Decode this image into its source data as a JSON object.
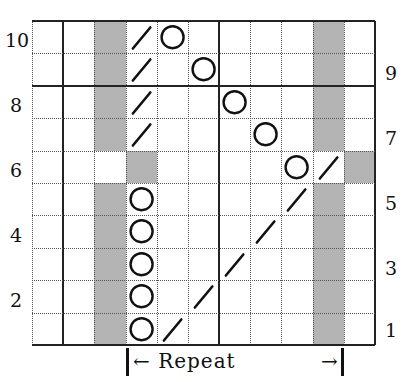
{
  "chart": {
    "columns": 11,
    "rows": 10,
    "shading_color": "#c9c9c9",
    "line_color": "#222222",
    "shaded_cells": [
      {
        "row": 10,
        "cols": [
          2,
          9
        ]
      },
      {
        "row": 9,
        "cols": [
          2,
          9
        ]
      },
      {
        "row": 8,
        "cols": [
          2,
          9
        ]
      },
      {
        "row": 7,
        "cols": [
          2,
          9
        ]
      },
      {
        "row": 6,
        "cols": [
          3,
          10
        ]
      },
      {
        "row": 5,
        "cols": [
          2,
          9
        ]
      },
      {
        "row": 4,
        "cols": [
          2,
          9
        ]
      },
      {
        "row": 3,
        "cols": [
          2,
          9
        ]
      },
      {
        "row": 2,
        "cols": [
          2,
          9
        ]
      },
      {
        "row": 1,
        "cols": [
          2,
          9
        ]
      }
    ],
    "symbols": [
      {
        "row": 10,
        "col": 3,
        "type": "slash"
      },
      {
        "row": 10,
        "col": 4,
        "type": "circle"
      },
      {
        "row": 9,
        "col": 3,
        "type": "slash"
      },
      {
        "row": 9,
        "col": 5,
        "type": "circle"
      },
      {
        "row": 8,
        "col": 3,
        "type": "slash"
      },
      {
        "row": 8,
        "col": 6,
        "type": "circle"
      },
      {
        "row": 7,
        "col": 3,
        "type": "slash"
      },
      {
        "row": 7,
        "col": 7,
        "type": "circle"
      },
      {
        "row": 6,
        "col": 8,
        "type": "circle"
      },
      {
        "row": 6,
        "col": 9,
        "type": "slash"
      },
      {
        "row": 5,
        "col": 3,
        "type": "circle"
      },
      {
        "row": 5,
        "col": 8,
        "type": "slash"
      },
      {
        "row": 4,
        "col": 3,
        "type": "circle"
      },
      {
        "row": 4,
        "col": 7,
        "type": "slash"
      },
      {
        "row": 3,
        "col": 3,
        "type": "circle"
      },
      {
        "row": 3,
        "col": 6,
        "type": "slash"
      },
      {
        "row": 2,
        "col": 3,
        "type": "circle"
      },
      {
        "row": 2,
        "col": 5,
        "type": "slash"
      },
      {
        "row": 1,
        "col": 3,
        "type": "circle"
      },
      {
        "row": 1,
        "col": 4,
        "type": "slash"
      }
    ],
    "solid_vertical_boundaries": [
      0,
      1,
      6,
      11
    ],
    "solid_horizontal_boundaries_below_row": [
      10,
      8,
      0
    ],
    "symbol_legend": {
      "circle": "circle-symbol (yarn over)",
      "slash": "slash-symbol (decrease)"
    }
  },
  "row_labels": {
    "left": [
      "10",
      "8",
      "6",
      "4",
      "2"
    ],
    "right": [
      "9",
      "7",
      "5",
      "3",
      "1"
    ]
  },
  "repeat": {
    "label": "Repeat",
    "left_arrow": "|←",
    "right_arrow": "→|",
    "start_col": 3,
    "end_col": 10
  }
}
